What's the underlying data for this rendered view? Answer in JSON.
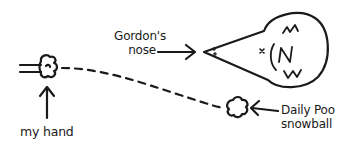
{
  "diagram": {
    "stroke_color": "#1a1a1a",
    "background": "#ffffff",
    "labels": {
      "my_hand": "my hand",
      "gordons_nose_line1": "Gordon's",
      "gordons_nose_line2": "nose",
      "snowball_line1": "Daily Poo",
      "snowball_line2": "snowball"
    },
    "elements": [
      {
        "name": "hand-fist",
        "icon": "fist-icon"
      },
      {
        "name": "gordon-head",
        "icon": "mole-head-icon"
      },
      {
        "name": "snowball",
        "icon": "snowball-icon"
      },
      {
        "name": "trajectory",
        "style": "dashed-curve"
      }
    ]
  }
}
